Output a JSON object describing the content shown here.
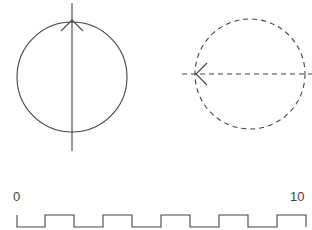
{
  "diagram": {
    "solid_circle": {
      "cx": 72,
      "cy": 77,
      "r": 55,
      "style": "solid",
      "arrow_direction": "up",
      "axis": "vertical"
    },
    "dashed_circle": {
      "cx": 250,
      "cy": 74,
      "r": 55,
      "style": "dashed",
      "arrow_direction": "left",
      "axis": "horizontal"
    },
    "square_wave": {
      "start_label": "0",
      "end_label": "10",
      "cycles": 5
    },
    "stroke_color": "#444444"
  }
}
